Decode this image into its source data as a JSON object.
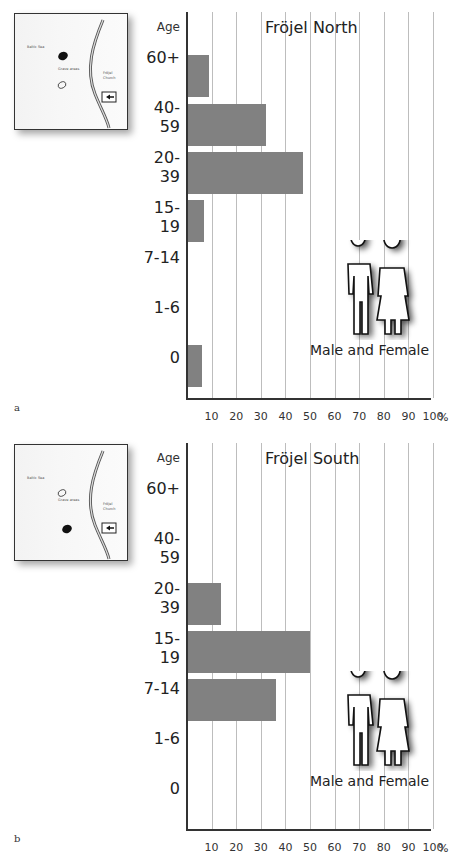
{
  "style": {
    "bar_color": "#818181",
    "grid_color": "#bdbdbd",
    "axis_color": "#333333"
  },
  "panels": [
    {
      "sublabel": "a",
      "title": "Fröjel North",
      "age_header": "Age",
      "legend": "Male and Female",
      "map": {
        "sea_label": "Baltic Sea",
        "grave_label": "Grave areas",
        "church_label_1": "Fröjel",
        "church_label_2": "Church",
        "highlight": "north"
      },
      "categories": [
        "60+",
        "40-59",
        "20-39",
        "15-19",
        "7-14",
        "1-6",
        "0"
      ],
      "values": [
        9,
        32,
        47,
        7,
        0,
        0,
        6
      ]
    },
    {
      "sublabel": "b",
      "title": "Fröjel South",
      "age_header": "Age",
      "legend": "Male and Female",
      "map": {
        "sea_label": "Baltic Sea",
        "grave_label": "Grave areas",
        "church_label_1": "Fröjel",
        "church_label_2": "Church",
        "highlight": "south"
      },
      "categories": [
        "60+",
        "40-59",
        "20-39",
        "15-19",
        "7-14",
        "1-6",
        "0"
      ],
      "values": [
        0,
        0,
        14,
        50,
        36,
        0,
        0
      ]
    }
  ],
  "x_ticks": [
    "10",
    "20",
    "30",
    "40",
    "50",
    "60",
    "70",
    "80",
    "90",
    "100"
  ],
  "x_unit": "%",
  "chart_data": [
    {
      "type": "bar",
      "orientation": "horizontal",
      "title": "Fröjel North",
      "categories": [
        "60+",
        "40-59",
        "20-39",
        "15-19",
        "7-14",
        "1-6",
        "0"
      ],
      "values": [
        9,
        32,
        47,
        7,
        0,
        0,
        6
      ],
      "xlabel": "%",
      "ylabel": "Age",
      "xlim": [
        0,
        100
      ],
      "x_ticks": [
        10,
        20,
        30,
        40,
        50,
        60,
        70,
        80,
        90,
        100
      ],
      "grid": "vertical",
      "legend": [
        "Male and Female"
      ],
      "annotations": [
        "a"
      ]
    },
    {
      "type": "bar",
      "orientation": "horizontal",
      "title": "Fröjel South",
      "categories": [
        "60+",
        "40-59",
        "20-39",
        "15-19",
        "7-14",
        "1-6",
        "0"
      ],
      "values": [
        0,
        0,
        14,
        50,
        36,
        0,
        0
      ],
      "xlabel": "%",
      "ylabel": "Age",
      "xlim": [
        0,
        100
      ],
      "x_ticks": [
        10,
        20,
        30,
        40,
        50,
        60,
        70,
        80,
        90,
        100
      ],
      "grid": "vertical",
      "legend": [
        "Male and Female"
      ],
      "annotations": [
        "b"
      ]
    }
  ]
}
